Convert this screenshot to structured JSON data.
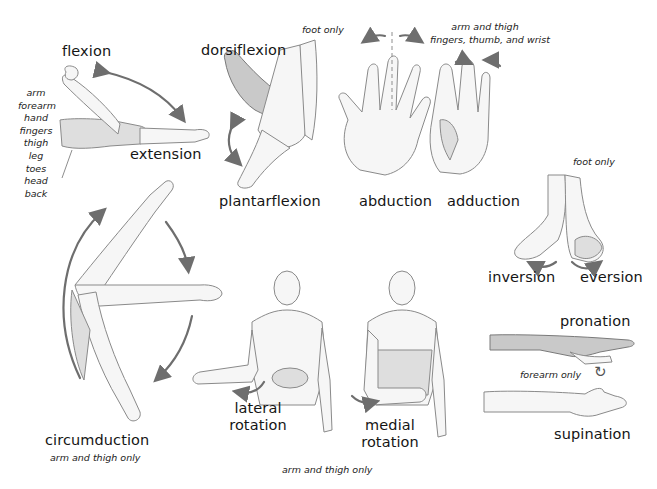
{
  "diagram": {
    "movements": {
      "flexion": {
        "label": "flexion"
      },
      "extension": {
        "label": "extension"
      },
      "flexion_parts": [
        "arm",
        "forearm",
        "hand",
        "fingers",
        "thigh",
        "leg",
        "toes",
        "head",
        "back"
      ],
      "dorsiflexion": {
        "label": "dorsiflexion",
        "note": "foot only"
      },
      "plantarflexion": {
        "label": "plantarflexion"
      },
      "abduction": {
        "label": "abduction"
      },
      "adduction": {
        "label": "adduction"
      },
      "ab_adduction_note_line1": "arm and thigh",
      "ab_adduction_note_line2": "fingers, thumb, and wrist",
      "inversion": {
        "label": "inversion"
      },
      "eversion": {
        "label": "eversion"
      },
      "inv_ev_note": "foot only",
      "circumduction": {
        "label": "circumduction",
        "note": "arm and thigh only"
      },
      "lateral_rotation": {
        "label_line1": "lateral",
        "label_line2": "rotation"
      },
      "medial_rotation": {
        "label_line1": "medial",
        "label_line2": "rotation"
      },
      "rotation_note": "arm and thigh only",
      "pronation": {
        "label": "pronation"
      },
      "supination": {
        "label": "supination"
      },
      "pro_sup_note": "forearm only"
    },
    "icons": {
      "rotate": "↻"
    },
    "colors": {
      "background": "#ffffff",
      "text": "#151515",
      "arrow": "#6e6e6e",
      "sketch": "#8a8a8a"
    }
  }
}
